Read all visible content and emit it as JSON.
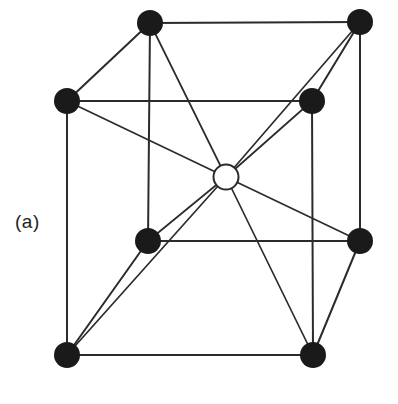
{
  "figure": {
    "panel_label": "(a)",
    "caption_text": "(a)",
    "background_color": "#ffffff",
    "edge_color": "#2b2b2b",
    "corner_atom_fill": "#1a1a1a",
    "center_atom_fill": "#ffffff",
    "center_atom_stroke": "#2b2b2b",
    "edge_width": 2,
    "diagonal_width": 1.7,
    "corner_atom_radius": 13,
    "center_atom_radius": 12.5
  },
  "chart_data": {
    "type": "diagram",
    "title": "(a)",
    "subtitle": "",
    "xlabel": "",
    "ylabel": "",
    "legend": [],
    "projection": "oblique",
    "lattice": "body-centered cubic",
    "atoms": [
      {
        "id": "back-top-left",
        "label": "corner-atom-back-top-left",
        "kind": "corner",
        "fill": "#1a1a1a",
        "x": 150,
        "y": 23,
        "r": 13,
        "lattice_position": [
          0,
          1,
          1
        ]
      },
      {
        "id": "back-top-right",
        "label": "corner-atom-back-top-right",
        "kind": "corner",
        "fill": "#1a1a1a",
        "x": 360,
        "y": 22,
        "r": 13,
        "lattice_position": [
          1,
          1,
          1
        ]
      },
      {
        "id": "front-top-left",
        "label": "corner-atom-front-top-left",
        "kind": "corner",
        "fill": "#1a1a1a",
        "x": 67,
        "y": 101,
        "r": 13,
        "lattice_position": [
          0,
          1,
          0
        ]
      },
      {
        "id": "front-top-right",
        "label": "corner-atom-front-top-right",
        "kind": "corner",
        "fill": "#1a1a1a",
        "x": 312,
        "y": 101,
        "r": 13,
        "lattice_position": [
          1,
          1,
          0
        ]
      },
      {
        "id": "back-bottom-left",
        "label": "corner-atom-back-bottom-left",
        "kind": "corner",
        "fill": "#1a1a1a",
        "x": 148,
        "y": 241,
        "r": 13,
        "lattice_position": [
          0,
          0,
          1
        ]
      },
      {
        "id": "back-bottom-right",
        "label": "corner-atom-back-bottom-right",
        "kind": "corner",
        "fill": "#1a1a1a",
        "x": 360,
        "y": 241,
        "r": 13,
        "lattice_position": [
          1,
          0,
          1
        ]
      },
      {
        "id": "front-bottom-left",
        "label": "corner-atom-front-bottom-left",
        "kind": "corner",
        "fill": "#1a1a1a",
        "x": 67,
        "y": 355,
        "r": 13,
        "lattice_position": [
          0,
          0,
          0
        ]
      },
      {
        "id": "front-bottom-right",
        "label": "corner-atom-front-bottom-right",
        "kind": "corner",
        "fill": "#1a1a1a",
        "x": 313,
        "y": 355,
        "r": 13,
        "lattice_position": [
          1,
          0,
          0
        ]
      },
      {
        "id": "body-center",
        "label": "center-atom",
        "kind": "center",
        "fill": "#ffffff",
        "x": 226,
        "y": 177,
        "r": 12.5,
        "lattice_position": [
          0.5,
          0.5,
          0.5
        ]
      }
    ],
    "cube_edges": [
      {
        "from": "back-top-left",
        "to": "back-top-right"
      },
      {
        "from": "back-top-left",
        "to": "front-top-left"
      },
      {
        "from": "back-top-left",
        "to": "back-bottom-left"
      },
      {
        "from": "back-top-right",
        "to": "front-top-right"
      },
      {
        "from": "back-top-right",
        "to": "back-bottom-right"
      },
      {
        "from": "front-top-left",
        "to": "front-top-right"
      },
      {
        "from": "front-top-left",
        "to": "front-bottom-left"
      },
      {
        "from": "front-top-right",
        "to": "front-bottom-right"
      },
      {
        "from": "back-bottom-left",
        "to": "back-bottom-right"
      },
      {
        "from": "back-bottom-left",
        "to": "front-bottom-left"
      },
      {
        "from": "back-bottom-right",
        "to": "front-bottom-right"
      },
      {
        "from": "front-bottom-left",
        "to": "front-bottom-right"
      }
    ],
    "body_diagonals": [
      {
        "from": "body-center",
        "to": "back-top-left"
      },
      {
        "from": "body-center",
        "to": "back-top-right"
      },
      {
        "from": "body-center",
        "to": "front-top-left"
      },
      {
        "from": "body-center",
        "to": "front-top-right"
      },
      {
        "from": "body-center",
        "to": "back-bottom-left"
      },
      {
        "from": "body-center",
        "to": "back-bottom-right"
      },
      {
        "from": "body-center",
        "to": "front-bottom-left"
      },
      {
        "from": "body-center",
        "to": "front-bottom-right"
      }
    ]
  }
}
